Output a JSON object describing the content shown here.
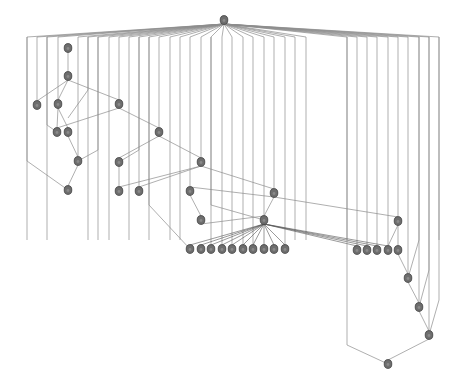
{
  "diagram": {
    "type": "hierarchical-graph",
    "background": "#ffffff",
    "node_color": "#6e6e6e",
    "node_stroke": "#3f3f3f",
    "edge_color": "#8c8c8c",
    "nodes": [
      {
        "id": "root",
        "x": 224,
        "y": 20
      },
      {
        "id": "n1",
        "x": 68,
        "y": 48
      },
      {
        "id": "n2",
        "x": 68,
        "y": 76
      },
      {
        "id": "n3",
        "x": 37,
        "y": 105
      },
      {
        "id": "n4",
        "x": 58,
        "y": 104
      },
      {
        "id": "n5",
        "x": 119,
        "y": 104
      },
      {
        "id": "n6",
        "x": 57,
        "y": 132
      },
      {
        "id": "n7",
        "x": 68,
        "y": 132
      },
      {
        "id": "n8",
        "x": 159,
        "y": 132
      },
      {
        "id": "n9",
        "x": 78,
        "y": 161
      },
      {
        "id": "n10",
        "x": 119,
        "y": 162
      },
      {
        "id": "n11",
        "x": 201,
        "y": 162
      },
      {
        "id": "n12",
        "x": 68,
        "y": 190
      },
      {
        "id": "n13",
        "x": 119,
        "y": 191
      },
      {
        "id": "n14",
        "x": 139,
        "y": 191
      },
      {
        "id": "n15",
        "x": 190,
        "y": 191
      },
      {
        "id": "n16",
        "x": 274,
        "y": 193
      },
      {
        "id": "n17",
        "x": 201,
        "y": 220
      },
      {
        "id": "n18",
        "x": 264,
        "y": 220
      },
      {
        "id": "n19",
        "x": 398,
        "y": 221
      },
      {
        "id": "b1",
        "x": 190,
        "y": 249
      },
      {
        "id": "b2",
        "x": 201,
        "y": 249
      },
      {
        "id": "b3",
        "x": 211,
        "y": 249
      },
      {
        "id": "b4",
        "x": 222,
        "y": 249
      },
      {
        "id": "b5",
        "x": 232,
        "y": 249
      },
      {
        "id": "b6",
        "x": 243,
        "y": 249
      },
      {
        "id": "b7",
        "x": 253,
        "y": 249
      },
      {
        "id": "b8",
        "x": 264,
        "y": 249
      },
      {
        "id": "b9",
        "x": 274,
        "y": 249
      },
      {
        "id": "b10",
        "x": 285,
        "y": 249
      },
      {
        "id": "r1",
        "x": 357,
        "y": 250
      },
      {
        "id": "r2",
        "x": 367,
        "y": 250
      },
      {
        "id": "r3",
        "x": 377,
        "y": 250
      },
      {
        "id": "r4",
        "x": 388,
        "y": 250
      },
      {
        "id": "r5",
        "x": 398,
        "y": 250
      },
      {
        "id": "c1",
        "x": 408,
        "y": 278
      },
      {
        "id": "c2",
        "x": 419,
        "y": 307
      },
      {
        "id": "c3",
        "x": 429,
        "y": 335
      },
      {
        "id": "sink",
        "x": 388,
        "y": 364
      }
    ],
    "root_fan_x": [
      27,
      37,
      47,
      58,
      78,
      88,
      98,
      109,
      119,
      129,
      139,
      149,
      159,
      170,
      180,
      190,
      201,
      211,
      222,
      232,
      243,
      253,
      264,
      274,
      285,
      295,
      306,
      347,
      357,
      367,
      377,
      388,
      398,
      408,
      419,
      429,
      439
    ],
    "root_fan_y": 37,
    "edges": [
      [
        "n1",
        "n2"
      ],
      [
        "n2",
        "n3"
      ],
      [
        "n2",
        "n4"
      ],
      [
        "n2",
        "n5"
      ],
      [
        "n4",
        "n6"
      ],
      [
        "n4",
        "n7"
      ],
      [
        "n5",
        "n6"
      ],
      [
        "n5",
        "n8"
      ],
      [
        "n7",
        "n9"
      ],
      [
        "n8",
        "n10"
      ],
      [
        "n8",
        "n11"
      ],
      [
        "n9",
        "n12"
      ],
      [
        "n10",
        "n13"
      ],
      [
        "n11",
        "n13"
      ],
      [
        "n11",
        "n14"
      ],
      [
        "n11",
        "n16"
      ],
      [
        "n16",
        "n15"
      ],
      [
        "n16",
        "n18"
      ],
      [
        "n16",
        "n19"
      ],
      [
        "n15",
        "n17"
      ],
      [
        "n17",
        "n18"
      ],
      [
        "n18",
        "b1"
      ],
      [
        "n18",
        "b2"
      ],
      [
        "n18",
        "b3"
      ],
      [
        "n18",
        "b4"
      ],
      [
        "n18",
        "b5"
      ],
      [
        "n18",
        "b6"
      ],
      [
        "n18",
        "b7"
      ],
      [
        "n18",
        "b8"
      ],
      [
        "n18",
        "b9"
      ],
      [
        "n18",
        "b10"
      ],
      [
        "n18",
        "r1"
      ],
      [
        "n18",
        "r2"
      ],
      [
        "n18",
        "r3"
      ],
      [
        "n18",
        "r4"
      ],
      [
        "n19",
        "r4"
      ],
      [
        "n19",
        "r5"
      ],
      [
        "r5",
        "c1"
      ],
      [
        "c1",
        "c2"
      ],
      [
        "c2",
        "c3"
      ],
      [
        "c3",
        "sink"
      ]
    ]
  }
}
